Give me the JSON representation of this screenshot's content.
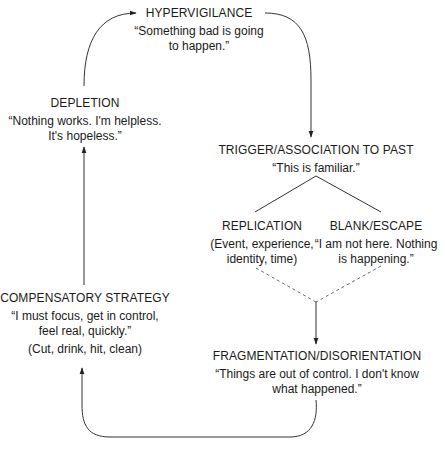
{
  "diagram": {
    "type": "cycle-flowchart",
    "colors": {
      "line": "#333333",
      "text": "#1a1a1a",
      "background": "#ffffff"
    },
    "nodes": {
      "hypervigilance": {
        "title": "HYPERVIGILANCE",
        "lines": [
          "“Something bad is going",
          "to happen.”"
        ]
      },
      "trigger": {
        "title": "TRIGGER/ASSOCIATION TO PAST",
        "lines": [
          "“This is familiar.”"
        ]
      },
      "replication": {
        "title": "REPLICATION",
        "lines": [
          "(Event, experience,",
          "identity, time)"
        ]
      },
      "blank_escape": {
        "title": "BLANK/ESCAPE",
        "lines": [
          "“I am not here. Nothing",
          "is happening.”"
        ]
      },
      "fragmentation": {
        "title": "FRAGMENTATION/DISORIENTATION",
        "lines": [
          "“Things are out of control. I don't know",
          "what happened.”"
        ]
      },
      "compensatory": {
        "title": "COMPENSATORY STRATEGY",
        "lines": [
          "“I must focus, get in control,",
          "feel real, quickly.”"
        ],
        "note": "(Cut, drink, hit, clean)"
      },
      "depletion": {
        "title": "DEPLETION",
        "lines": [
          "“Nothing works. I'm helpless.",
          "It's hopeless.”"
        ]
      }
    },
    "edges": [
      {
        "from": "depletion",
        "to": "hypervigilance",
        "style": "solid",
        "arrow": true
      },
      {
        "from": "hypervigilance",
        "to": "trigger",
        "style": "solid",
        "arrow": true
      },
      {
        "from": "trigger",
        "to": "replication",
        "style": "solid",
        "arrow": false
      },
      {
        "from": "trigger",
        "to": "blank_escape",
        "style": "solid",
        "arrow": false
      },
      {
        "from": "replication",
        "to": "fragmentation",
        "style": "dashed",
        "arrow": false
      },
      {
        "from": "blank_escape",
        "to": "fragmentation",
        "style": "dashed",
        "arrow": true
      },
      {
        "from": "fragmentation",
        "to": "compensatory",
        "style": "solid",
        "arrow": true
      },
      {
        "from": "compensatory",
        "to": "depletion",
        "style": "solid",
        "arrow": true
      }
    ]
  }
}
